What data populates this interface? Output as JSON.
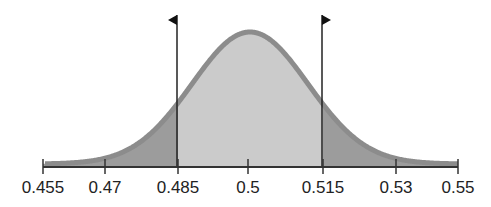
{
  "chart_data": {
    "type": "area",
    "title": "",
    "xlabel": "",
    "ylabel": "",
    "distribution": {
      "mean": 0.5,
      "sd": 0.015
    },
    "xlim": [
      0.455,
      0.55
    ],
    "tick_labels": [
      "0.455",
      "0.47",
      "0.485",
      "0.5",
      "0.515",
      "0.53",
      "0.55"
    ],
    "ticks": [
      0.455,
      0.47,
      0.485,
      0.5,
      0.515,
      0.53,
      0.55
    ],
    "markers": [
      {
        "x": 0.485,
        "label": "",
        "type": "flag-left"
      },
      {
        "x": 0.515,
        "label": "",
        "type": "flag-right"
      }
    ],
    "regions": [
      {
        "name": "left-tail",
        "from": 0.455,
        "to": 0.485,
        "color": "#9c9c9c"
      },
      {
        "name": "center",
        "from": 0.485,
        "to": 0.515,
        "color": "#cbcbcb"
      },
      {
        "name": "right-tail",
        "from": 0.515,
        "to": 0.55,
        "color": "#9c9c9c"
      }
    ],
    "grid": false,
    "legend": null
  },
  "colors": {
    "outline": "#8c8c8c",
    "center_fill": "#cbcbcb",
    "tail_fill": "#9c9c9c",
    "axis": "#333333"
  }
}
